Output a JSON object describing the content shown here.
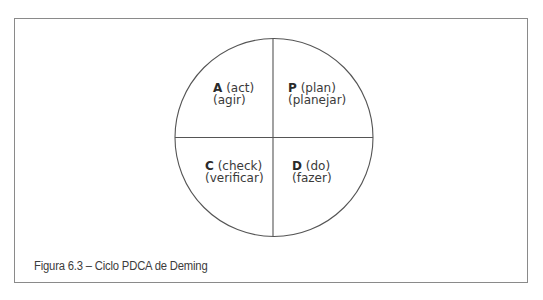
{
  "figure": {
    "caption": "Figura 6.3 – Ciclo PDCA de Deming"
  },
  "diagram": {
    "type": "circle-quadrants",
    "title": "Ciclo PDCA",
    "stroke_color": "#555555",
    "frame_color": "#8a8a8a",
    "quadrants": [
      {
        "position": "top-left",
        "letter": "A",
        "english": "(act)",
        "portuguese": "(agir)"
      },
      {
        "position": "top-right",
        "letter": "P",
        "english": "(plan)",
        "portuguese": "(planejar)"
      },
      {
        "position": "bottom-left",
        "letter": "C",
        "english": "(check)",
        "portuguese": "(verificar)"
      },
      {
        "position": "bottom-right",
        "letter": "D",
        "english": "(do)",
        "portuguese": "(fazer)"
      }
    ]
  }
}
